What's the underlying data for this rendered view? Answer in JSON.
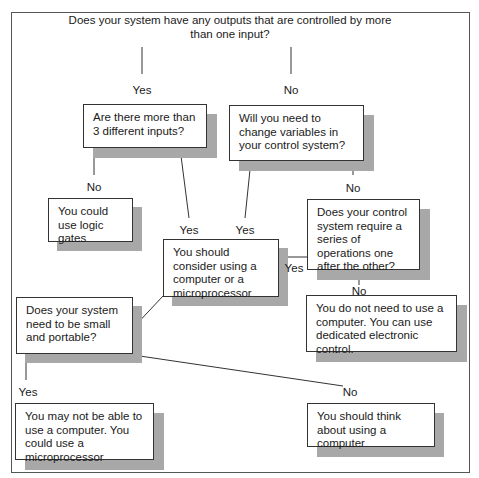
{
  "title": "Does your system have any outputs that are controlled by more than one input?",
  "nodes": {
    "q_more_inputs": "Are there more than 3 different inputs?",
    "q_change_vars": "Will you need to change variables in your control system?",
    "a_logic_gates": "You could use logic gates",
    "a_consider_computer": "You should consider using a computer or a microprocessor",
    "q_series_ops": "Does your control system require a series of operations one after the other?",
    "a_dedicated": "You do not need to use a computer. You can use dedicated electronic control.",
    "q_small_portable": "Does your system need to be small and portable?",
    "a_microprocessor": "You may not be able to use a computer. You could use a microprocessor",
    "a_think_computer": "You should think about using a computer"
  },
  "labels": {
    "top_yes": "Yes",
    "top_no": "No",
    "inputs_no": "No",
    "inputs_yes": "Yes",
    "vars_yes": "Yes",
    "vars_no": "No",
    "series_yes": "Yes",
    "series_no": "No",
    "portable_yes": "Yes",
    "portable_no": "No"
  },
  "colors": {
    "shadow": "#a8a8a8",
    "border": "#333333",
    "line": "#333333"
  }
}
